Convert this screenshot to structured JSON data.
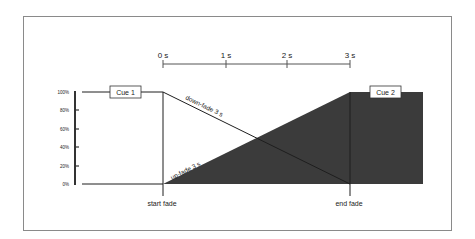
{
  "diagram": {
    "timeline": {
      "ticks": [
        {
          "label": "0 s",
          "x": 163
        },
        {
          "label": "1 s",
          "x": 226
        },
        {
          "label": "2 s",
          "x": 287
        },
        {
          "label": "3 s",
          "x": 350
        }
      ]
    },
    "y_axis": {
      "ticks": [
        {
          "label": "100%",
          "y": 92
        },
        {
          "label": "80%",
          "y": 110
        },
        {
          "label": "60%",
          "y": 129
        },
        {
          "label": "40%",
          "y": 147
        },
        {
          "label": "20%",
          "y": 166
        },
        {
          "label": "0%",
          "y": 184
        }
      ]
    },
    "cues": [
      {
        "label": "Cue 1"
      },
      {
        "label": "Cue 2"
      }
    ],
    "fades": {
      "down": {
        "label": "down-fade 3 s"
      },
      "up": {
        "label": "up-fade 3 s"
      }
    },
    "markers": {
      "start": {
        "label": "start fade"
      },
      "end": {
        "label": "end fade"
      }
    },
    "colors": {
      "fill_dark": "#3b3b3b",
      "line": "#1e1e1e",
      "frame": "#8a8a8a",
      "timeline": "#555555"
    }
  }
}
